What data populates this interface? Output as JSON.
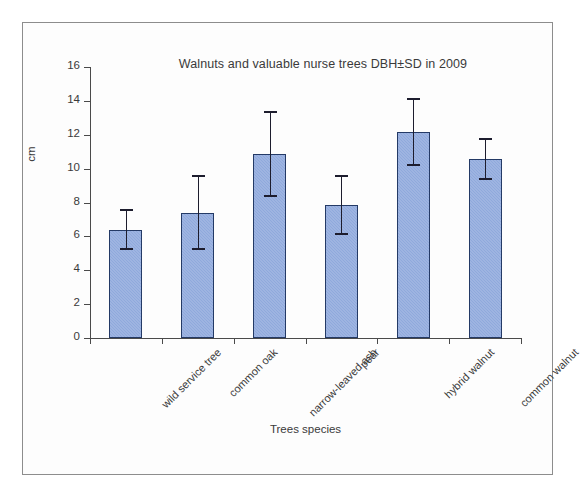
{
  "chart_data": {
    "type": "bar",
    "title": "Walnuts and valuable nurse trees DBH±SD in 2009",
    "xlabel": "Trees species",
    "ylabel": "cm",
    "ylim": [
      0,
      16
    ],
    "ytick_step": 2,
    "ytick_labels": [
      "16",
      "14",
      "12",
      "10",
      "8",
      "6",
      "4",
      "2",
      "0"
    ],
    "grid": false,
    "legend": "none",
    "error_type": "SD",
    "categories": [
      "wild service tree",
      "common oak",
      "narrow-leaved ash",
      "pear",
      "hybrid walnut",
      "common walnut"
    ],
    "values": [
      6.4,
      7.4,
      10.85,
      7.85,
      12.15,
      10.55
    ],
    "errors": [
      1.2,
      2.2,
      2.55,
      1.75,
      2.0,
      1.25
    ],
    "points": [
      {
        "category": "wild service tree",
        "value": 6.4,
        "error": 1.2,
        "lower": 5.2,
        "upper": 7.6
      },
      {
        "category": "common oak",
        "value": 7.4,
        "error": 2.2,
        "lower": 5.2,
        "upper": 9.6
      },
      {
        "category": "narrow-leaved ash",
        "value": 10.85,
        "error": 2.55,
        "lower": 8.3,
        "upper": 13.4
      },
      {
        "category": "pear",
        "value": 7.85,
        "error": 1.75,
        "lower": 6.1,
        "upper": 9.6
      },
      {
        "category": "hybrid walnut",
        "value": 12.15,
        "error": 2.0,
        "lower": 10.15,
        "upper": 14.15
      },
      {
        "category": "common walnut",
        "value": 10.55,
        "error": 1.25,
        "lower": 9.3,
        "upper": 11.8
      }
    ],
    "colors": {
      "bar_fill": "#8fa9dc",
      "bar_border": "#243a66",
      "error_bar": "#1d1d2e",
      "axis": "#4a4a4a",
      "text": "#3a3a3a",
      "frame": "#8d8d8d",
      "background": "#fdfdfd"
    }
  }
}
